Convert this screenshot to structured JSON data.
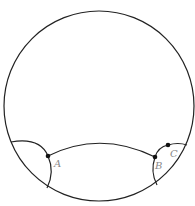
{
  "diagram": {
    "type": "poincare-disk",
    "stroke_color": "#222222",
    "label_color": "#8a8a8a",
    "points": [
      {
        "label": "A",
        "x": 48,
        "y": 156
      },
      {
        "label": "B",
        "x": 155,
        "y": 157
      },
      {
        "label": "C",
        "x": 168,
        "y": 145
      }
    ]
  }
}
